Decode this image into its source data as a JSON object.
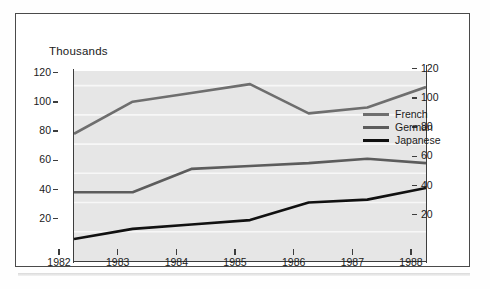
{
  "figure": {
    "title": "Thousands"
  },
  "legend": {
    "position": "inside-right",
    "entries": [
      {
        "label": "French",
        "color": "#6e6e6e"
      },
      {
        "label": "German",
        "color": "#5c5c5c"
      },
      {
        "label": "Japanese",
        "color": "#111111"
      }
    ]
  },
  "axes": {
    "left": {
      "ticks": [
        "20",
        "40",
        "60",
        "80",
        "100",
        "120"
      ]
    },
    "right": {
      "ticks": [
        "20",
        "40",
        "60",
        "80",
        "100",
        "120"
      ]
    },
    "bottom": {
      "ticks": [
        "1982",
        "1983",
        "1984",
        "1985",
        "1986",
        "1987",
        "1988"
      ]
    }
  },
  "colors": {
    "plot_background": "#e6e6e6",
    "gridline": "#f7f7f7",
    "axis": "#3d3d3d",
    "frame": "#4a4a4a",
    "text": "#1a1a1a"
  },
  "chart_data": {
    "type": "line",
    "title": "Thousands",
    "xlabel": "",
    "ylabel": "Thousands",
    "x": [
      1982,
      1983,
      1984,
      1985,
      1986,
      1987,
      1988
    ],
    "categories": [
      "1982",
      "1983",
      "1984",
      "1985",
      "1986",
      "1987",
      "1988"
    ],
    "series": [
      {
        "name": "French",
        "color": "#6e6e6e",
        "values": [
          87,
          109,
          115,
          121,
          101,
          105,
          119
        ]
      },
      {
        "name": "German",
        "color": "#5c5c5c",
        "values": [
          47,
          47,
          63,
          65,
          67,
          70,
          67
        ]
      },
      {
        "name": "Japanese",
        "color": "#111111",
        "values": [
          15,
          22,
          25,
          28,
          40,
          42,
          50
        ]
      }
    ],
    "ylim": [
      0,
      130
    ],
    "ylim_right": [
      0,
      130
    ],
    "xlim": [
      1982,
      1988
    ],
    "yticks": [
      20,
      40,
      60,
      80,
      100,
      120
    ],
    "yticks_right": [
      20,
      40,
      60,
      80,
      100,
      120
    ],
    "grid": "horizontal",
    "legend_position": "center right"
  }
}
